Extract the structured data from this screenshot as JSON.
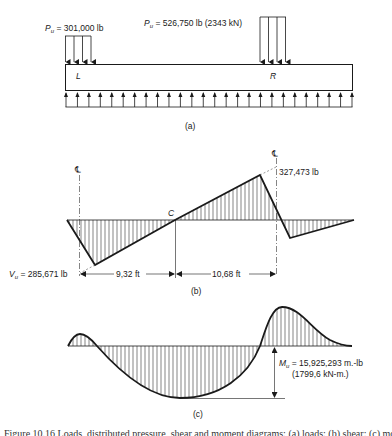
{
  "panel_a": {
    "left_load_label_sym": "P",
    "left_load_label_sub": "u",
    "left_load_value": " = 301,000 lb",
    "right_load_label_sym": "P",
    "right_load_label_sub": "u",
    "right_load_value": " = 526,750 lb (2343 kN)",
    "left_column_label": "L",
    "right_column_label": "R",
    "panel_label": "(a)"
  },
  "panel_b": {
    "centerline_left": "℄",
    "centerline_right": "℄",
    "point_c_label": "C",
    "max_positive_shear": "327,473 lb",
    "vu_label_sym": "V",
    "vu_label_sub": "u",
    "vu_value": " = 285,671 lb",
    "dim_left": "9,32 ft",
    "dim_right": "10,68 ft",
    "panel_label": "(b)"
  },
  "panel_c": {
    "mu_label_sym": "M",
    "mu_label_sub": "u",
    "mu_value": " = 15,925,293 m.-lb",
    "mu_value_si": "(1799,6 kN-m.)",
    "panel_label": "(c)"
  },
  "caption": "Figure 10.16 Loads, distributed pressure, shear and moment diagrams: (a) loads; (b) shear; (c) moment"
}
